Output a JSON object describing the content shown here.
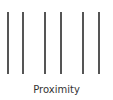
{
  "diagram": {
    "title": "Proximity",
    "line_color": "#555555",
    "lines_x": [
      8,
      23,
      44,
      60,
      82,
      98
    ],
    "groups": 3
  }
}
